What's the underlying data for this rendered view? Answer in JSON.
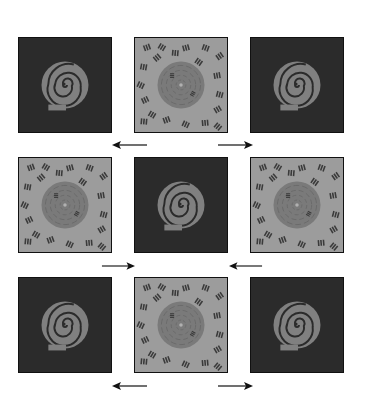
{
  "figure": {
    "colors": {
      "background": "#ffffff",
      "dark_panel": "#2b2b2b",
      "textured_panel": "#9c9c9c",
      "spiral": "#808080",
      "spiral_in_texture": "#7a7a7a",
      "distractor_marks": "#3a3a3a",
      "border": "#111111",
      "arrow": "#111111"
    },
    "rows": [
      {
        "panels": [
          {
            "type": "dark",
            "content": "spiral"
          },
          {
            "type": "textured",
            "content": "spiral-with-distractors"
          },
          {
            "type": "dark",
            "content": "spiral"
          }
        ],
        "arrows_below": [
          {
            "direction": "left"
          },
          {
            "direction": "right"
          }
        ]
      },
      {
        "panels": [
          {
            "type": "textured",
            "content": "spiral-with-distractors"
          },
          {
            "type": "dark",
            "content": "spiral"
          },
          {
            "type": "textured",
            "content": "spiral-with-distractors"
          }
        ],
        "arrows_below": [
          {
            "direction": "right"
          },
          {
            "direction": "left"
          }
        ]
      },
      {
        "panels": [
          {
            "type": "dark",
            "content": "spiral"
          },
          {
            "type": "textured",
            "content": "spiral-with-distractors"
          },
          {
            "type": "dark",
            "content": "spiral"
          }
        ],
        "arrows_below": [
          {
            "direction": "left"
          },
          {
            "direction": "right"
          }
        ]
      }
    ]
  }
}
